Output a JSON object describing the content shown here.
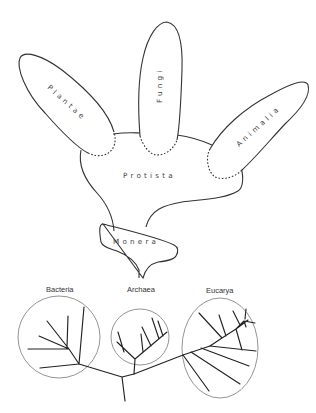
{
  "five_kingdom_model": {
    "kingdoms": [
      {
        "id": "plantae",
        "label": "Plantae"
      },
      {
        "id": "fungi",
        "label": "Fungi"
      },
      {
        "id": "animalia",
        "label": "Animalia"
      },
      {
        "id": "protista",
        "label": "Protista"
      },
      {
        "id": "monera",
        "label": "Monera"
      }
    ]
  },
  "three_domain_tree": {
    "domains": [
      {
        "id": "bacteria",
        "label": "Bacteria"
      },
      {
        "id": "archaea",
        "label": "Archaea"
      },
      {
        "id": "eucarya",
        "label": "Eucarya"
      }
    ]
  },
  "colors": {
    "stroke": "#333333",
    "domain_circle": "#888888",
    "background": "#ffffff"
  }
}
